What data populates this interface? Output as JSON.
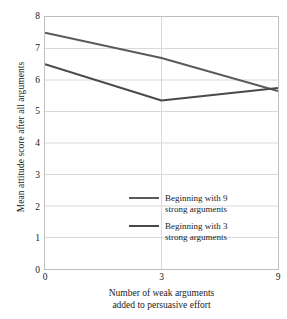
{
  "chart_data": {
    "type": "line",
    "title": "",
    "xlabel": "Number of weak arguments added to persuasive effort",
    "xlabel_line1": "Number of weak arguments",
    "xlabel_line2": "added to persuasive effort",
    "ylabel": "Mean attitude score after all arguments",
    "x": [
      0,
      3,
      9
    ],
    "xtick_labels": [
      "0",
      "3",
      "9"
    ],
    "ytick_labels": [
      "8",
      "7",
      "6",
      "5",
      "4",
      "3",
      "2",
      "1",
      "0"
    ],
    "ylim": [
      0,
      8
    ],
    "grid": "horizontal",
    "legend_position": "inside lower-right",
    "series": [
      {
        "name": "Beginning with 9 strong arguments",
        "name_line1": "Beginning with 9",
        "name_line2": "strong arguments",
        "color": "#5a5a5a",
        "values": [
          7.5,
          6.7,
          5.65
        ]
      },
      {
        "name": "Beginning with 3 strong arguments",
        "name_line1": "Beginning with 3",
        "name_line2": "strong arguments",
        "color": "#4a4a4a",
        "values": [
          6.5,
          5.35,
          5.75
        ]
      }
    ],
    "colors": {
      "axis": "#bfbfbf",
      "gridline": "#d9d9d9",
      "text": "#1a1a1a",
      "background": "#ffffff"
    }
  }
}
